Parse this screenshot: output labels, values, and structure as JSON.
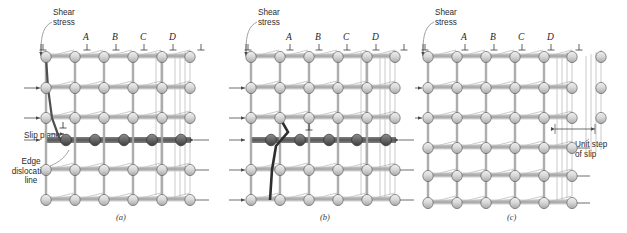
{
  "figure": {
    "background": "#ffffff",
    "width": 627,
    "height": 233
  },
  "colors": {
    "atom_light": "#d6d6d6",
    "atom_light_stroke": "#5a5a5a",
    "atom_dark": "#6e6e6e",
    "atom_dark_stroke": "#2a2a2a",
    "atom_darkest": "#3b3b3b",
    "bond": "#8a8a8a",
    "bond_highlight": "#b9b9b9",
    "slip_plane_band": "#9a9a9a",
    "text": "#2b2b2b",
    "leader": "#6f6f6f",
    "arrow": "#4a4a4a"
  },
  "panels": [
    {
      "id": "a",
      "letter": "(a)",
      "shear_label": "Shear\nstress",
      "columns": [
        "A",
        "B",
        "C",
        "D"
      ],
      "annotations": [
        {
          "name": "slip-plane",
          "text": "Slip plane"
        },
        {
          "name": "edge-dislocation-line",
          "text": "Edge\ndislocation\nline"
        }
      ],
      "dislocation_column": "A",
      "dislocation_symbol": "⊥",
      "shear_arrow_count_left": 4,
      "shear_arrow_count_right": 3
    },
    {
      "id": "b",
      "letter": "(b)",
      "shear_label": "Shear\nstress",
      "columns": [
        "A",
        "B",
        "C",
        "D"
      ],
      "annotations": [],
      "dislocation_column": "B",
      "dislocation_symbol": "⊥",
      "shear_arrow_count_left": 5,
      "shear_arrow_count_right": 5
    },
    {
      "id": "c",
      "letter": "(c)",
      "shear_label": "Shear\nstress",
      "columns": [
        "A",
        "B",
        "C",
        "D"
      ],
      "annotations": [
        {
          "name": "unit-step-of-slip",
          "text": "Unit step\nof slip"
        }
      ],
      "dislocation_column": null,
      "dislocation_symbol": "⊥",
      "shear_arrow_count_left": 6,
      "shear_arrow_count_right": 4
    }
  ],
  "symbols": {
    "perpendicular": "⊥",
    "arrow_right": "→"
  }
}
